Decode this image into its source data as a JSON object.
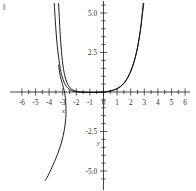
{
  "chart_data": {
    "type": "line",
    "title": "",
    "subtitle": "",
    "xlabel": "x",
    "ylabel": "y",
    "xlim": [
      -6.4,
      6.4
    ],
    "ylim": [
      -5.6,
      5.6
    ],
    "grid": false,
    "legend": "none",
    "x_ticks_major": [
      -6,
      -5,
      -4,
      -3,
      -2,
      -1,
      0,
      1,
      2,
      3,
      4,
      5,
      6
    ],
    "x_tick_labels": [
      "-6",
      "-5",
      "-4",
      "-3",
      "-2",
      "-1",
      "0",
      "1",
      "2",
      "3",
      "4",
      "5",
      "6"
    ],
    "y_ticks_major": [
      -5.0,
      -2.5,
      2.5,
      5.0
    ],
    "y_tick_labels": [
      "-5.0",
      "-2.5",
      "2.5",
      "5.0"
    ],
    "y_tick_minor_step": 0.5,
    "x_tick_minor_step": 0.5,
    "series": [
      {
        "name": "curve-a",
        "note": "steep exponential-type curve, negative branch rising to top-left and flat approaching zero from the right",
        "points": [
          [
            -3.3,
            5.6
          ],
          [
            -3.22,
            4.2
          ],
          [
            -3.14,
            3.1
          ],
          [
            -3.05,
            2.2
          ],
          [
            -2.95,
            1.5
          ],
          [
            -2.84,
            1.0
          ],
          [
            -2.7,
            0.62
          ],
          [
            -2.55,
            0.36
          ],
          [
            -2.35,
            0.18
          ],
          [
            -2.1,
            0.07
          ],
          [
            -1.8,
            0.02
          ],
          [
            -1.4,
            -0.01
          ],
          [
            -1.0,
            -0.02
          ],
          [
            -0.5,
            -0.02
          ],
          [
            0.0,
            0.0
          ],
          [
            0.5,
            0.06
          ],
          [
            1.0,
            0.2
          ],
          [
            1.4,
            0.45
          ],
          [
            1.75,
            0.85
          ],
          [
            2.05,
            1.4
          ],
          [
            2.3,
            2.05
          ],
          [
            2.5,
            2.8
          ],
          [
            2.66,
            3.6
          ],
          [
            2.8,
            4.5
          ],
          [
            2.92,
            5.6
          ]
        ]
      },
      {
        "name": "curve-b",
        "note": "second steep curve, nearly parallel and slightly offset from curve-a",
        "points": [
          [
            -3.62,
            5.6
          ],
          [
            -3.52,
            4.2
          ],
          [
            -3.42,
            3.1
          ],
          [
            -3.3,
            2.2
          ],
          [
            -3.18,
            1.5
          ],
          [
            -3.05,
            1.0
          ],
          [
            -2.9,
            0.62
          ],
          [
            -2.72,
            0.34
          ],
          [
            -2.5,
            0.16
          ],
          [
            -2.22,
            0.05
          ],
          [
            -1.9,
            0.0
          ],
          [
            -1.5,
            -0.02
          ],
          [
            -1.05,
            -0.03
          ],
          [
            -0.55,
            -0.02
          ],
          [
            0.0,
            0.0
          ],
          [
            0.55,
            0.08
          ],
          [
            1.05,
            0.24
          ],
          [
            1.45,
            0.52
          ],
          [
            1.8,
            0.95
          ],
          [
            2.1,
            1.55
          ],
          [
            2.34,
            2.22
          ],
          [
            2.54,
            3.0
          ],
          [
            2.7,
            3.85
          ],
          [
            2.84,
            4.8
          ],
          [
            2.96,
            5.6
          ]
        ]
      },
      {
        "name": "curve-c",
        "note": "descending branch passing near x=-3 and falling steeply to the lower left of the frame",
        "points": [
          [
            -3.3,
            1.7
          ],
          [
            -3.22,
            1.2
          ],
          [
            -3.12,
            0.8
          ],
          [
            -3.0,
            0.45
          ],
          [
            -2.92,
            0.18
          ],
          [
            -2.86,
            0.0
          ],
          [
            -2.82,
            -0.25
          ],
          [
            -2.78,
            -0.6
          ],
          [
            -2.76,
            -1.0
          ],
          [
            -2.76,
            -1.45
          ],
          [
            -2.8,
            -1.9
          ],
          [
            -2.88,
            -2.4
          ],
          [
            -3.0,
            -2.9
          ],
          [
            -3.16,
            -3.4
          ],
          [
            -3.36,
            -3.9
          ],
          [
            -3.6,
            -4.4
          ],
          [
            -3.86,
            -4.9
          ],
          [
            -4.14,
            -5.4
          ],
          [
            -4.3,
            -5.6
          ]
        ]
      }
    ]
  },
  "annotations": {
    "x_axis_name": "x",
    "y_axis_name": "y"
  },
  "colors": {
    "curve": "#111111",
    "axis": "#1a1a1a",
    "label": "#2b2b2b",
    "background": "#ffffff"
  }
}
